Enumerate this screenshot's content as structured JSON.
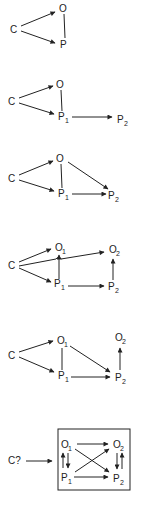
{
  "diagrams": [
    {
      "id": 1,
      "nodes": {
        "C": "C",
        "O": "O",
        "P": "P"
      },
      "edges": [
        [
          "C",
          "O",
          "arrow"
        ],
        [
          "C",
          "P",
          "arrow"
        ],
        [
          "O",
          "P",
          "line"
        ]
      ]
    },
    {
      "id": 2,
      "nodes": {
        "C": "C",
        "O": "O",
        "P1": "P",
        "P1_sub": "1",
        "P2": "P",
        "P2_sub": "2"
      },
      "edges": [
        [
          "C",
          "O",
          "arrow"
        ],
        [
          "C",
          "P1",
          "arrow"
        ],
        [
          "O",
          "P1",
          "line"
        ],
        [
          "P1",
          "P2",
          "arrow"
        ]
      ]
    },
    {
      "id": 3,
      "nodes": {
        "C": "C",
        "O": "O",
        "P1": "P",
        "P1_sub": "1",
        "P2": "P",
        "P2_sub": "2"
      },
      "edges": [
        [
          "C",
          "O",
          "arrow"
        ],
        [
          "C",
          "P1",
          "arrow"
        ],
        [
          "O",
          "P1",
          "line"
        ],
        [
          "O",
          "P2",
          "arrow"
        ],
        [
          "P1",
          "P2",
          "arrow"
        ]
      ]
    },
    {
      "id": 4,
      "nodes": {
        "C": "C",
        "O1": "O",
        "O1_sub": "1",
        "O2": "O",
        "O2_sub": "2",
        "P1": "P",
        "P1_sub": "1",
        "P2": "P",
        "P2_sub": "2"
      },
      "edges": [
        [
          "C",
          "O1",
          "arrow"
        ],
        [
          "C",
          "O2",
          "arrow"
        ],
        [
          "C",
          "P1",
          "arrow"
        ],
        [
          "P1",
          "O1",
          "arrow"
        ],
        [
          "P1",
          "P2",
          "arrow"
        ],
        [
          "P2",
          "O2",
          "arrow"
        ]
      ]
    },
    {
      "id": 5,
      "nodes": {
        "C": "C",
        "O1": "O",
        "O1_sub": "1",
        "O2": "O",
        "O2_sub": "2",
        "P1": "P",
        "P1_sub": "1",
        "P2": "P",
        "P2_sub": "2"
      },
      "edges": [
        [
          "C",
          "O1",
          "arrow"
        ],
        [
          "C",
          "P1",
          "arrow"
        ],
        [
          "O1",
          "P1",
          "line"
        ],
        [
          "O1",
          "P2",
          "arrow"
        ],
        [
          "P1",
          "P2",
          "arrow"
        ],
        [
          "P2",
          "O2",
          "arrow"
        ]
      ]
    },
    {
      "id": 6,
      "nodes": {
        "C": "C?",
        "O1": "O",
        "O1_sub": "1",
        "O2": "O",
        "O2_sub": "2",
        "P1": "P",
        "P1_sub": "1",
        "P2": "P",
        "P2_sub": "2"
      },
      "edges": [
        [
          "C",
          "box",
          "arrow"
        ],
        [
          "O1",
          "O2",
          "arrow"
        ],
        [
          "P1",
          "P2",
          "arrow"
        ],
        [
          "O1",
          "P2",
          "arrow"
        ],
        [
          "P1",
          "O2",
          "arrow"
        ],
        [
          "O1",
          "P1",
          "bidirectional"
        ],
        [
          "O2",
          "P2",
          "bidirectional"
        ]
      ],
      "boxed": true
    }
  ]
}
